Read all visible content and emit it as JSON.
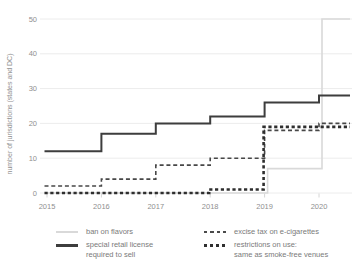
{
  "chart": {
    "y_axis_title": "number of jurisdictions (states and DC)"
  },
  "chart_data": {
    "type": "line",
    "subtype": "step-after",
    "title": "",
    "xlabel": "",
    "ylabel": "number of jurisdictions (states and DC)",
    "x": [
      2015,
      2016,
      2017,
      2018,
      2019,
      2020
    ],
    "x_ticks": [
      "2015",
      "2016",
      "2017",
      "2018",
      "2019",
      "2020"
    ],
    "y_ticks": [
      0,
      10,
      20,
      30,
      40,
      50
    ],
    "ylim": [
      0,
      50
    ],
    "xlim": [
      2015,
      2020.6
    ],
    "grid": true,
    "legend_position": "bottom",
    "colors": {
      "grid": "#ececec",
      "tick_label": "#8f8f8f",
      "axis_title": "#8f8f8f",
      "tick_mark": "#d6d6d6"
    },
    "series": [
      {
        "name": "ban on flavors",
        "values": [
          0,
          0,
          0,
          0,
          7,
          50
        ],
        "style": "solid-light",
        "color": "#d9d9d9",
        "x_offset": 3
      },
      {
        "name": "special retail license required to sell",
        "values": [
          12,
          17,
          20,
          22,
          26,
          28
        ],
        "style": "solid",
        "color": "#3d3d3d",
        "x_offset": 0
      },
      {
        "name": "excise tax on e-cigarettes",
        "values": [
          2,
          4,
          8,
          10,
          18,
          20
        ],
        "style": "dashed",
        "color": "#474747",
        "x_offset": 0
      },
      {
        "name": "restrictions on use: same as smoke-free venues",
        "values": [
          0,
          0,
          0,
          1,
          19,
          19
        ],
        "style": "dashed-thick",
        "color": "#2e2e2e",
        "x_offset": -1
      }
    ]
  },
  "legend": {
    "items": [
      {
        "label": "ban on flavors",
        "label2": ""
      },
      {
        "label": "special retail license",
        "label2": "required to sell"
      },
      {
        "label": "excise tax on e-cigarettes",
        "label2": ""
      },
      {
        "label": "restrictions on use:",
        "label2": "same as smoke-free venues"
      }
    ]
  }
}
